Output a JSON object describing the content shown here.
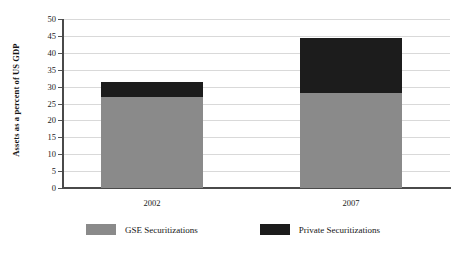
{
  "chart_data": {
    "type": "bar",
    "subtype": "stacked",
    "title": "",
    "xlabel": "",
    "ylabel": "Assets as a percent of US GDP",
    "categories": [
      "2002",
      "2007"
    ],
    "series": [
      {
        "name": "GSE Securitizations",
        "color": "#8a8a8a",
        "values": [
          27,
          28
        ]
      },
      {
        "name": "Private Securitizations",
        "color": "#1c1c1c",
        "values": [
          4.5,
          16.5
        ]
      }
    ],
    "totals": [
      31.5,
      44.5
    ],
    "ylim": [
      0,
      50
    ],
    "ytick_labels": [
      "0",
      "5",
      "10",
      "15",
      "20",
      "25",
      "30",
      "35",
      "40",
      "45",
      "50"
    ],
    "ytick_values": [
      0,
      5,
      10,
      15,
      20,
      25,
      30,
      35,
      40,
      45,
      50
    ],
    "grid": true,
    "legend_position": "bottom"
  },
  "axis": {
    "y_title": "Assets as a percent of US GDP"
  },
  "legend": {
    "items": [
      {
        "label": "GSE Securitizations",
        "color": "#8a8a8a"
      },
      {
        "label": "Private Securitizations",
        "color": "#1c1c1c"
      }
    ]
  }
}
